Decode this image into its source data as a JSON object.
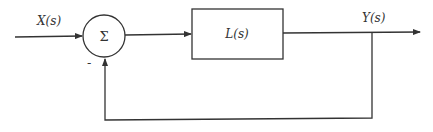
{
  "diagram": {
    "type": "feedback-control-block-diagram",
    "input_label": "X(s)",
    "summing_junction_symbol": "Σ",
    "feedback_sign": "-",
    "block_label": "L(s)",
    "output_label": "Y(s)",
    "colors": {
      "stroke": "#333333",
      "background": "#ffffff"
    }
  }
}
